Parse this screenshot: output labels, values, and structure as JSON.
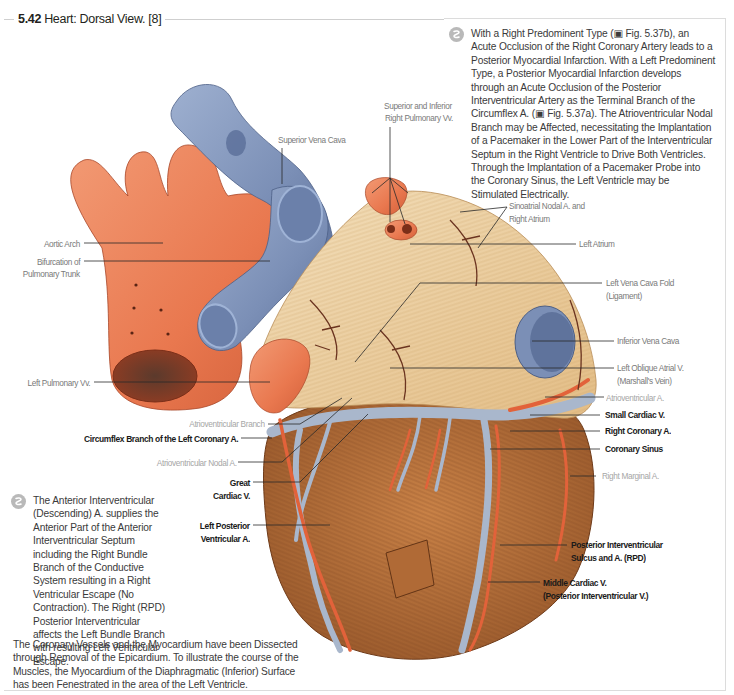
{
  "figure": {
    "number": "5.42",
    "title": "Heart: Dorsal View. [8]"
  },
  "notes": {
    "top_right": "With a Right Predominent Type (▣ Fig. 5.37b), an Acute Occlusion of the Right Coronary Artery leads to a Posterior Myocardial Infarction. With a Left Predominent Type, a Posterior Myocardial Infarction develops through an Acute Occlusion of the Posterior Interventricular Artery as the Terminal Branch of the Circumflex A. (▣ Fig. 5.37a). The Atrioventricular Nodal Branch may be Affected, necessitating the Implantation of a Pacemaker in the Lower Part of the Interventricular Septum in the Right Ventricle to Drive Both Ventricles. Through the Implantation of a Pacemaker Probe into the Coronary Sinus, the Left Ventricle may be Stimulated Electrically.",
    "bottom_left": "The Anterior Interventricular (Descending) A. supplies the Anterior Part of the Anterior Interventricular Septum including the Right Bundle Branch of the Conductive System resulting in a Right Ventricular Escape (No Contraction). The Right (RPD) Posterior Interventricular affects the Left Bundle Branch with resulting Left Ventricular Escape.",
    "icon": "clinical-note-icon"
  },
  "caption": "The Coronary Vessels and the Myocardium have been Dissected through Removal of the Epicardium. To illustrate the course of the Muscles, the Myocardium of the Diaphragmatic (Inferior) Surface has been Fenestrated in the area of the Left Ventricle.",
  "labels": {
    "superior_vena_cava": "Superior Vena Cava",
    "right_pulmonary_vv_1": "Superior and Inferior",
    "right_pulmonary_vv_2": "Right Pulmonary Vv.",
    "aortic_arch": "Aortic Arch",
    "bifurcation_1": "Bifurcation of",
    "bifurcation_2": "Pulmonary Trunk",
    "left_pulmonary_vv": "Left Pulmonary Vv.",
    "sinoatrial_1": "Sinoatrial Nodal A. and",
    "sinoatrial_2": "Right Atrium",
    "left_atrium": "Left Atrium",
    "left_vena_cava_fold_1": "Left Vena Cava Fold",
    "left_vena_cava_fold_2": "(Ligament)",
    "inferior_vena_cava": "Inferior Vena Cava",
    "left_oblique_atrial_1": "Left Oblique Atrial V.",
    "left_oblique_atrial_2": "(Marshall's Vein)",
    "atrioventricular_a": "Atrioventricular A.",
    "small_cardiac_v": "Small Cardiac V.",
    "right_coronary_a": "Right Coronary A.",
    "coronary_sinus": "Coronary Sinus",
    "right_marginal_a": "Right Marginal A.",
    "post_interventricular_1": "Posterior Interventricular",
    "post_interventricular_2": "Sulcus and A. (RPD)",
    "middle_cardiac_1": "Middle Cardiac V.",
    "middle_cardiac_2": "(Posterior Interventricular V.)",
    "atrioventricular_branch": "Atrioventricular Branch",
    "circumflex_branch": "Circumflex Branch of the Left Coronary A.",
    "av_nodal_a": "Atrioventricular Nodal A.",
    "great_cardiac_1": "Great",
    "great_cardiac_2": "Cardiac V.",
    "left_post_ventricular_1": "Left Posterior",
    "left_post_ventricular_2": "Ventricular A."
  },
  "colors": {
    "artery": "#e9784f",
    "vein": "#7f93b8",
    "atrium_fibers": "#eed3a6",
    "myocardium": "#b9723e",
    "leader_line": "#2a2a2a"
  }
}
